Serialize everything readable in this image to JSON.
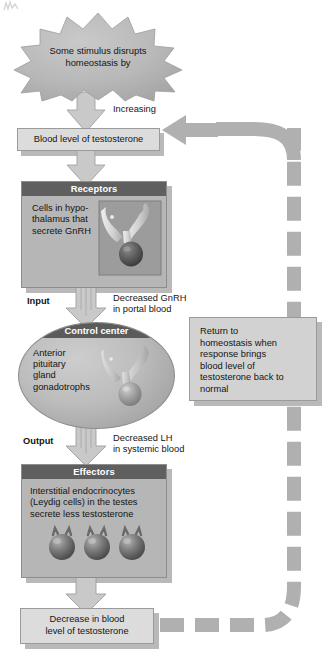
{
  "colors": {
    "page_background": "#ffffff",
    "light_box_fill": "#dcdcdc",
    "light_box_border": "#9a9a9a",
    "panel_fill": "#b6b6b6",
    "panel_header_fill": "#5f5f5f",
    "panel_header_text": "#ffffff",
    "oval_fill": "#bdbdbd",
    "arrow_fill": "#c9c9c9",
    "arrow_outline": "#9e9e9e",
    "feedback_path": "#b0b0b0",
    "shadow": "#b9b9b9",
    "body_text": "#141414",
    "burst_fill": "#b9b9b9"
  },
  "stimulus": {
    "shape": "starburst",
    "text": "Some stimulus disrupts\nhomeostasis by"
  },
  "arrows": {
    "increasing_label": "Increasing",
    "input_label": "Input",
    "input_note": "Decreased GnRH\nin portal blood",
    "output_label": "Output",
    "output_note": "Decreased LH\nin systemic blood"
  },
  "blood_level_box": {
    "text": "Blood level of testosterone"
  },
  "receptors": {
    "header": "Receptors",
    "body": "Cells in hypo-\nthalamus that\nsecrete GnRH",
    "illustration": "hypothalamus-pituitary-icon"
  },
  "control_center": {
    "header": "Control center",
    "body": "Anterior\npituitary\ngland\ngonadotrophs",
    "illustration": "pituitary-gland-icon"
  },
  "effectors": {
    "header": "Effectors",
    "body": "Interstitial endocrinocytes\n(Leydig cells) in the testes\nsecrete less testosterone",
    "illustration": "leydig-cells-icon",
    "cell_count": 3
  },
  "response_box": {
    "text": "Decrease in blood\nlevel of testosterone"
  },
  "return_box": {
    "text": "Return to\nhomeostasis when\nresponse brings\nblood level of\ntestosterone back to\nnormal"
  },
  "feedback_loop": {
    "style": "dashed",
    "direction": "counter-clockwise",
    "head": "arrow-left-icon"
  }
}
